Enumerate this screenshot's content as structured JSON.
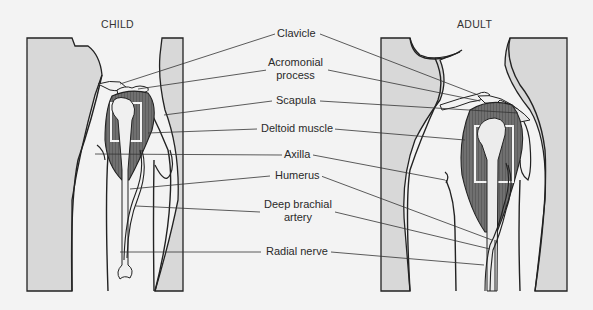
{
  "figure": {
    "panels": [
      {
        "id": "child",
        "title": "CHILD"
      },
      {
        "id": "adult",
        "title": "ADULT"
      }
    ],
    "labels": [
      {
        "id": "clavicle",
        "text": "Clavicle"
      },
      {
        "id": "acromonial-process",
        "line1": "Acromonial",
        "line2": "process"
      },
      {
        "id": "scapula",
        "text": "Scapula"
      },
      {
        "id": "deltoid-muscle",
        "text": "Deltoid muscle"
      },
      {
        "id": "axilla",
        "text": "Axilla"
      },
      {
        "id": "humerus",
        "text": "Humerus"
      },
      {
        "id": "deep-brachial-artery",
        "line1": "Deep brachial",
        "line2": "artery"
      },
      {
        "id": "radial-nerve",
        "text": "Radial nerve"
      }
    ],
    "colors": {
      "background": "#f3f3f3",
      "panel_fill": "#dcdcdc",
      "body_fill": "#e6e6e6",
      "muscle": "#6e6e6e",
      "bone": "#f0f0f0",
      "outline": "#1e1e1e",
      "leader": "#333333",
      "injection_box": "#f4f4f4"
    }
  }
}
